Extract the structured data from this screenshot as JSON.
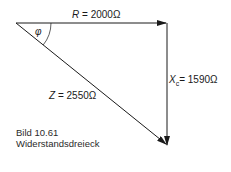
{
  "diagram": {
    "type": "impedance-triangle",
    "angle_symbol": "φ",
    "resistance": {
      "symbol": "R",
      "value": "2000",
      "unit": "Ω"
    },
    "reactance": {
      "symbol": "X",
      "subscript": "c",
      "value": "1590",
      "unit": "Ω"
    },
    "impedance": {
      "symbol": "Z",
      "value": "2550",
      "unit": "Ω"
    },
    "equals": "="
  },
  "caption": {
    "figure": "Bild 10.61",
    "title": "Widerstandsdreieck"
  },
  "colors": {
    "line": "#1a1a1a",
    "background": "#ffffff"
  }
}
